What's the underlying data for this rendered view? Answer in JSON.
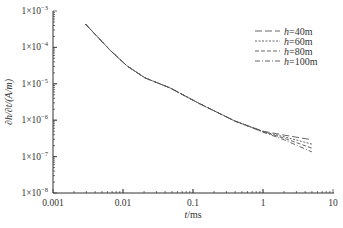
{
  "chart_data": {
    "type": "line",
    "title": "",
    "xlabel": "t/ms",
    "ylabel": "∂h/∂t/(A/m)",
    "xscale": "log",
    "yscale": "log",
    "xlim": [
      0.001,
      10
    ],
    "ylim": [
      1e-08,
      0.001
    ],
    "grid": false,
    "legend_position": "upper right",
    "x_ticks": [
      "0.001",
      "0.01",
      "0.1",
      "1",
      "10"
    ],
    "y_ticks": [
      "1×10⁻³",
      "1×10⁻⁴",
      "1×10⁻⁵",
      "1×10⁻⁶",
      "1×10⁻⁷",
      "1×10⁻⁸"
    ],
    "series": [
      {
        "name": "h=40m",
        "style": "long-dash",
        "x": [
          0.0029,
          0.0065,
          0.0114,
          0.0206,
          0.047,
          0.126,
          0.395,
          1.0,
          2.0,
          5.0
        ],
        "y": [
          0.00044,
          8.5e-05,
          3.1e-05,
          1.45e-05,
          7.7e-06,
          2.8e-06,
          9.5e-07,
          5e-07,
          3.9e-07,
          2.9e-07
        ]
      },
      {
        "name": "h=60m",
        "style": "short-dash",
        "x": [
          0.0029,
          0.0065,
          0.0114,
          0.0206,
          0.047,
          0.126,
          0.395,
          1.0,
          2.0,
          5.0
        ],
        "y": [
          0.00044,
          8.5e-05,
          3.1e-05,
          1.45e-05,
          7.7e-06,
          2.8e-06,
          9.5e-07,
          4.9e-07,
          3.5e-07,
          2.2e-07
        ]
      },
      {
        "name": "h=80m",
        "style": "medium-dash",
        "x": [
          0.0029,
          0.0065,
          0.0114,
          0.0206,
          0.047,
          0.126,
          0.395,
          1.0,
          2.0,
          5.0
        ],
        "y": [
          0.00044,
          8.5e-05,
          3.1e-05,
          1.45e-05,
          7.7e-06,
          2.8e-06,
          9.5e-07,
          4.8e-07,
          3.2e-07,
          1.7e-07
        ]
      },
      {
        "name": "h=100m",
        "style": "dash-dot",
        "x": [
          0.0029,
          0.0065,
          0.0114,
          0.0206,
          0.047,
          0.126,
          0.395,
          1.0,
          2.0,
          5.0
        ],
        "y": [
          0.00044,
          8.5e-05,
          3.1e-05,
          1.45e-05,
          7.7e-06,
          2.8e-06,
          9.5e-07,
          4.7e-07,
          2.9e-07,
          1.35e-07
        ]
      }
    ]
  },
  "legend": {
    "items": [
      {
        "prefix": "h",
        "suffix": "=40m"
      },
      {
        "prefix": "h",
        "suffix": "=60m"
      },
      {
        "prefix": "h",
        "suffix": "=80m"
      },
      {
        "prefix": "h",
        "suffix": "=100m"
      }
    ]
  },
  "axes": {
    "x_title_var": "t",
    "x_title_unit": "/ms",
    "y_title": "∂h/∂t/(A/m)",
    "x_ticks": [
      "0.001",
      "0.01",
      "0.1",
      "1",
      "10"
    ],
    "y_ticks": [
      {
        "base": "1×10",
        "exp": "-3"
      },
      {
        "base": "1×10",
        "exp": "-4"
      },
      {
        "base": "1×10",
        "exp": "-5"
      },
      {
        "base": "1×10",
        "exp": "-6"
      },
      {
        "base": "1×10",
        "exp": "-7"
      },
      {
        "base": "1×10",
        "exp": "-8"
      }
    ]
  },
  "colors": {
    "line": "#555555",
    "axis": "#333333"
  }
}
